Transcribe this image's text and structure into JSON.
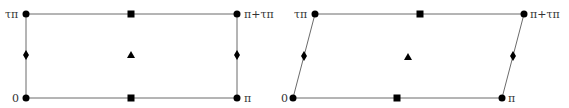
{
  "figures": [
    {
      "name": "rectangle-lattice",
      "shape": "rectangle",
      "corners": {
        "bottom_left": {
          "x": 26,
          "y": 98,
          "label": "0"
        },
        "bottom_right": {
          "x": 237,
          "y": 98,
          "label": "π"
        },
        "top_left": {
          "x": 26,
          "y": 14,
          "label": "τπ"
        },
        "top_right": {
          "x": 237,
          "y": 14,
          "label": "π+τπ"
        }
      },
      "markers": {
        "squares": [
          {
            "x": 131,
            "y": 14
          },
          {
            "x": 131,
            "y": 98
          }
        ],
        "diamonds": [
          {
            "x": 26,
            "y": 55
          },
          {
            "x": 237,
            "y": 55
          }
        ],
        "triangle": {
          "x": 131,
          "y": 55
        }
      }
    },
    {
      "name": "parallelogram-lattice",
      "shape": "parallelogram",
      "corners": {
        "bottom_left": {
          "x": 293,
          "y": 98,
          "label": "0"
        },
        "bottom_right": {
          "x": 502,
          "y": 98,
          "label": "π"
        },
        "top_left": {
          "x": 315,
          "y": 14,
          "label": "τπ"
        },
        "top_right": {
          "x": 524,
          "y": 14,
          "label": "π+τπ"
        }
      },
      "markers": {
        "squares": [
          {
            "x": 420,
            "y": 14
          },
          {
            "x": 397,
            "y": 98
          }
        ],
        "diamonds": [
          {
            "x": 304,
            "y": 56
          },
          {
            "x": 513,
            "y": 56
          }
        ],
        "triangle": {
          "x": 408,
          "y": 57
        }
      }
    }
  ],
  "colors": {
    "edge": "#6b6b6b",
    "marker": "#000000",
    "label": "#333333"
  }
}
